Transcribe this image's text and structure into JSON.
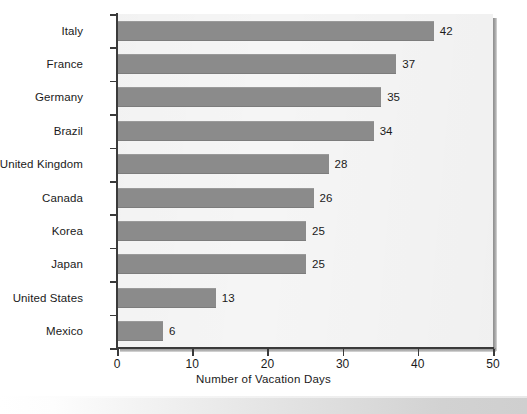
{
  "chart_data": {
    "type": "bar",
    "orientation": "horizontal",
    "title": "",
    "xlabel": "Number of Vacation Days",
    "ylabel": "",
    "xlim": [
      0,
      50
    ],
    "xticks": [
      0,
      10,
      20,
      30,
      40,
      50
    ],
    "xtick_labels": [
      "0",
      "10",
      "20",
      "30",
      "40",
      "50"
    ],
    "grid": false,
    "legend": null,
    "categories": [
      "Italy",
      "France",
      "Germany",
      "Brazil",
      "United Kingdom",
      "Canada",
      "Korea",
      "Japan",
      "United States",
      "Mexico"
    ],
    "values": [
      42,
      37,
      35,
      34,
      28,
      26,
      25,
      25,
      13,
      6
    ],
    "value_labels": [
      "42",
      "37",
      "35",
      "34",
      "28",
      "26",
      "25",
      "25",
      "13",
      "6"
    ],
    "series": [
      {
        "name": "Number of Vacation Days",
        "values": [
          42,
          37,
          35,
          34,
          28,
          26,
          25,
          25,
          13,
          6
        ]
      }
    ],
    "colors": {
      "bar": "#8b8b8b",
      "plot_background": "#f5f5f5",
      "axis": "#3a3a3a",
      "text": "#1a1a1a",
      "page_background": "#ffffff"
    }
  }
}
